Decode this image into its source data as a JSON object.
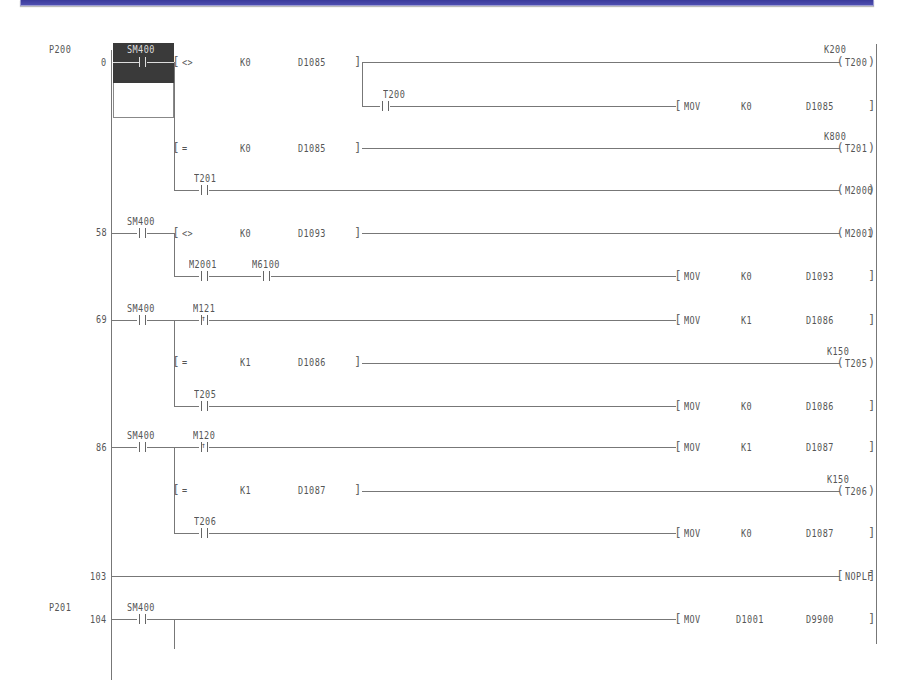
{
  "window": {
    "titlebar_color": "#3f3fa3"
  },
  "ladder": {
    "pointer_labels": [
      "P200",
      "P201"
    ],
    "step_numbers": [
      "0",
      "58",
      "69",
      "86",
      "103",
      "104"
    ],
    "rungs": [
      {
        "step": "0",
        "pointer": "P200",
        "contact": "SM400",
        "selected": true,
        "branches": [
          {
            "type": "compare",
            "op": "<>",
            "s1": "K0",
            "s2": "D1085",
            "coil": "T200",
            "coil_setting": "K200"
          },
          {
            "type": "sub-contact",
            "contact": "T200",
            "instruction": "MOV",
            "arg1": "K0",
            "arg2": "D1085"
          },
          {
            "type": "compare",
            "op": "=",
            "s1": "K0",
            "s2": "D1085",
            "coil": "T201",
            "coil_setting": "K800"
          },
          {
            "type": "contact",
            "contact": "T201",
            "coil": "M2000"
          }
        ]
      },
      {
        "step": "58",
        "contact": "SM400",
        "branches": [
          {
            "type": "compare",
            "op": "<>",
            "s1": "K0",
            "s2": "D1093",
            "coil": "M2001"
          },
          {
            "type": "contact-series",
            "contacts": [
              "M2001",
              "M6100"
            ],
            "instruction": "MOV",
            "arg1": "K0",
            "arg2": "D1093"
          }
        ]
      },
      {
        "step": "69",
        "contact": "SM400",
        "branches": [
          {
            "type": "pulse-contact",
            "contact": "M121",
            "instruction": "MOV",
            "arg1": "K1",
            "arg2": "D1086"
          },
          {
            "type": "compare",
            "op": "=",
            "s1": "K1",
            "s2": "D1086",
            "coil": "T205",
            "coil_setting": "K150"
          },
          {
            "type": "contact",
            "contact": "T205",
            "instruction": "MOV",
            "arg1": "K0",
            "arg2": "D1086"
          }
        ]
      },
      {
        "step": "86",
        "contact": "SM400",
        "branches": [
          {
            "type": "pulse-contact",
            "contact": "M120",
            "instruction": "MOV",
            "arg1": "K1",
            "arg2": "D1087"
          },
          {
            "type": "compare",
            "op": "=",
            "s1": "K1",
            "s2": "D1087",
            "coil": "T206",
            "coil_setting": "K150"
          },
          {
            "type": "contact",
            "contact": "T206",
            "instruction": "MOV",
            "arg1": "K0",
            "arg2": "D1087"
          }
        ]
      },
      {
        "step": "103",
        "instruction": "NOPLF"
      },
      {
        "step": "104",
        "pointer": "P201",
        "contact": "SM400",
        "branches": [
          {
            "type": "contact",
            "instruction": "MOV",
            "arg1": "D1001",
            "arg2": "D9900"
          }
        ]
      }
    ],
    "text": {
      "p200": "P200",
      "p201": "P201",
      "s0": "0",
      "s58": "58",
      "s69": "69",
      "s86": "86",
      "s103": "103",
      "s104": "104",
      "sm400": "SM400",
      "op_ne": "<>",
      "op_eq": "=",
      "k0": "K0",
      "k1": "K1",
      "d1085": "D1085",
      "d1093": "D1093",
      "d1086": "D1086",
      "d1087": "D1087",
      "d1001": "D1001",
      "d9900": "D9900",
      "t200": "T200",
      "t201": "T201",
      "t205": "T205",
      "t206": "T206",
      "k200": "K200",
      "k800": "K800",
      "k150": "K150",
      "m2000": "M2000",
      "m2001": "M2001",
      "m6100": "M6100",
      "m121": "M121",
      "m120": "M120",
      "mov": "MOV",
      "noplf": "NOPLF"
    }
  }
}
